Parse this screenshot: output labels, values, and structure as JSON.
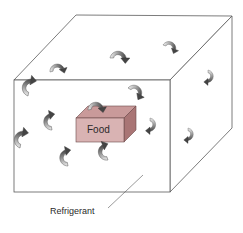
{
  "diagram": {
    "title": "",
    "labels": {
      "food": "Food",
      "refrigerant": "Refrigerant"
    },
    "colors": {
      "edge": "#5a5a5a",
      "food_front": "#d9b3b3",
      "food_top": "#c99a9a",
      "food_side": "#a97575",
      "arrow_light": "#e6e6e6",
      "arrow_dark": "#555555"
    },
    "elements": [
      "cube",
      "food-box",
      "circulation-arrows",
      "refrigerant-label"
    ]
  }
}
